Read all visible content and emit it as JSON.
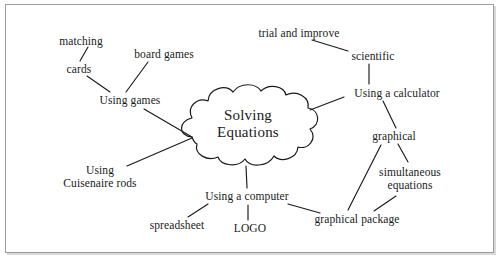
{
  "diagram": {
    "type": "mind-map",
    "frame": {
      "border_color": "#9d9d9d",
      "background": "#ffffff"
    },
    "line_color": "#1a1a1a",
    "text_color": "#1a1a1a",
    "central_node": {
      "id": "solving-equations",
      "label_line1": "Solving",
      "label_line2": "Equations",
      "shape": "cloud",
      "x": 247,
      "y": 124
    },
    "nodes": [
      {
        "id": "matching",
        "label": "matching",
        "x": 81,
        "y": 41
      },
      {
        "id": "cards",
        "label": "cards",
        "x": 79,
        "y": 69
      },
      {
        "id": "board-games",
        "label": "board games",
        "x": 164,
        "y": 54
      },
      {
        "id": "using-games",
        "label": "Using games",
        "x": 130,
        "y": 100
      },
      {
        "id": "using-cuisenaire",
        "label_line1": "Using",
        "label_line2": "Cuisenaire rods",
        "x": 100,
        "y": 177
      },
      {
        "id": "trial-and-improve",
        "label": "trial and improve",
        "x": 299,
        "y": 33
      },
      {
        "id": "scientific",
        "label": "scientific",
        "x": 373,
        "y": 56
      },
      {
        "id": "using-calculator",
        "label": "Using a calculator",
        "x": 397,
        "y": 93
      },
      {
        "id": "graphical",
        "label": "graphical",
        "x": 394,
        "y": 136
      },
      {
        "id": "simultaneous-eq",
        "label_line1": "simultaneous",
        "label_line2": "equations",
        "x": 410,
        "y": 179
      },
      {
        "id": "using-computer",
        "label": "Using a computer",
        "x": 247,
        "y": 196
      },
      {
        "id": "spreadsheet",
        "label": "spreadsheet",
        "x": 177,
        "y": 225
      },
      {
        "id": "logo",
        "label": "LOGO",
        "x": 250,
        "y": 228
      },
      {
        "id": "graphical-package",
        "label": "graphical package",
        "x": 357,
        "y": 219
      }
    ],
    "edges": [
      {
        "from": "matching",
        "to": "cards",
        "x1": 88,
        "y1": 47,
        "x2": 80,
        "y2": 61
      },
      {
        "from": "cards",
        "to": "using-games",
        "x1": 87,
        "y1": 76,
        "x2": 110,
        "y2": 92
      },
      {
        "from": "board-games",
        "to": "using-games",
        "x1": 148,
        "y1": 62,
        "x2": 126,
        "y2": 92
      },
      {
        "from": "using-games",
        "to": "solving-equations",
        "x1": 144,
        "y1": 109,
        "x2": 192,
        "y2": 137
      },
      {
        "from": "using-cuisenaire",
        "to": "solving-equations",
        "x1": 127,
        "y1": 166,
        "x2": 192,
        "y2": 138
      },
      {
        "from": "trial-and-improve",
        "to": "scientific",
        "x1": 312,
        "y1": 40,
        "x2": 348,
        "y2": 51
      },
      {
        "from": "scientific",
        "to": "using-calculator",
        "x1": 369,
        "y1": 64,
        "x2": 369,
        "y2": 84
      },
      {
        "from": "solving-equations",
        "to": "using-calculator",
        "x1": 310,
        "y1": 110,
        "x2": 344,
        "y2": 97
      },
      {
        "from": "using-calculator",
        "to": "graphical",
        "x1": 383,
        "y1": 101,
        "x2": 396,
        "y2": 128
      },
      {
        "from": "graphical",
        "to": "simultaneous-eq",
        "x1": 398,
        "y1": 144,
        "x2": 408,
        "y2": 162
      },
      {
        "from": "graphical",
        "to": "graphical-package",
        "x1": 381,
        "y1": 145,
        "x2": 348,
        "y2": 210
      },
      {
        "from": "simultaneous-eq",
        "to": "graphical-package",
        "x1": 396,
        "y1": 196,
        "x2": 374,
        "y2": 211
      },
      {
        "from": "solving-equations",
        "to": "using-computer",
        "x1": 246,
        "y1": 166,
        "x2": 247,
        "y2": 188
      },
      {
        "from": "using-computer",
        "to": "spreadsheet",
        "x1": 208,
        "y1": 204,
        "x2": 188,
        "y2": 217
      },
      {
        "from": "using-computer",
        "to": "logo",
        "x1": 248,
        "y1": 205,
        "x2": 248,
        "y2": 220
      },
      {
        "from": "using-computer",
        "to": "graphical-package",
        "x1": 288,
        "y1": 204,
        "x2": 320,
        "y2": 213
      }
    ]
  }
}
